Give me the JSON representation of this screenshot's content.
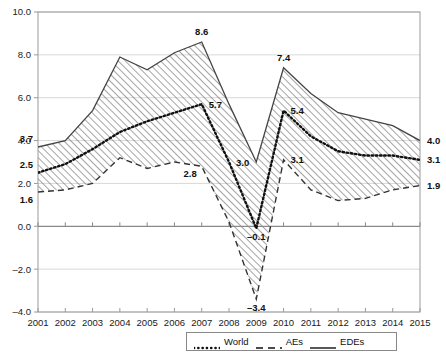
{
  "chart_data": {
    "type": "line",
    "title": "",
    "subtitle": "",
    "xlabel": "",
    "ylabel": "",
    "x": [
      2001,
      2002,
      2003,
      2004,
      2005,
      2006,
      2007,
      2008,
      2009,
      2010,
      2011,
      2012,
      2013,
      2014,
      2015
    ],
    "categories": [
      "2001",
      "2002",
      "2003",
      "2004",
      "2005",
      "2006",
      "2007",
      "2008",
      "2009",
      "2010",
      "2011",
      "2012",
      "2013",
      "2014",
      "2015"
    ],
    "xlim": [
      2001,
      2015
    ],
    "ylim": [
      -4.0,
      10.0
    ],
    "yticks": [
      -4.0,
      -2.0,
      0.0,
      2.0,
      4.0,
      6.0,
      8.0,
      10.0
    ],
    "ytick_labels": [
      "-4.0",
      "-2.0",
      "0.0",
      "2.0",
      "4.0",
      "6.0",
      "8.0",
      "10.0"
    ],
    "grid": true,
    "grid_axis": "y",
    "legend_position": "bottom-right",
    "band_between": [
      "AEs",
      "EDEs"
    ],
    "band_fill": "diagonal-hatch",
    "series": [
      {
        "name": "World",
        "style": "dotted",
        "color": "#111111",
        "values": [
          2.5,
          2.9,
          3.6,
          4.4,
          4.9,
          5.3,
          5.7,
          3.0,
          -0.1,
          5.4,
          4.2,
          3.5,
          3.3,
          3.3,
          3.1
        ]
      },
      {
        "name": "AEs",
        "style": "dashed",
        "color": "#333333",
        "values": [
          1.6,
          1.7,
          2.0,
          3.2,
          2.7,
          3.0,
          2.8,
          0.2,
          -3.4,
          3.1,
          1.7,
          1.2,
          1.3,
          1.7,
          1.9
        ]
      },
      {
        "name": "EDEs",
        "style": "solid",
        "color": "#444444",
        "values": [
          3.7,
          4.0,
          5.4,
          7.9,
          7.3,
          8.1,
          8.6,
          5.7,
          3.0,
          7.4,
          6.2,
          5.3,
          5.0,
          4.7,
          4.0
        ]
      }
    ],
    "annotations": [
      {
        "label": "3.7",
        "series": "EDEs",
        "x": 2001,
        "y": 3.7,
        "pos": "above-left"
      },
      {
        "label": "2.5",
        "series": "World",
        "x": 2001,
        "y": 2.5,
        "pos": "above-left"
      },
      {
        "label": "1.6",
        "series": "AEs",
        "x": 2001,
        "y": 1.6,
        "pos": "below-left"
      },
      {
        "label": "8.6",
        "series": "EDEs",
        "x": 2007,
        "y": 8.6,
        "pos": "above"
      },
      {
        "label": "5.7",
        "series": "World",
        "x": 2007,
        "y": 5.7,
        "pos": "right"
      },
      {
        "label": "2.8",
        "series": "AEs",
        "x": 2007,
        "y": 2.8,
        "pos": "below-left"
      },
      {
        "label": "3.0",
        "series": "EDEs",
        "x": 2009,
        "y": 3.0,
        "pos": "left"
      },
      {
        "label": "-0.1",
        "series": "World",
        "x": 2009,
        "y": -0.1,
        "pos": "below"
      },
      {
        "label": "-3.4",
        "series": "AEs",
        "x": 2009,
        "y": -3.4,
        "pos": "below"
      },
      {
        "label": "7.4",
        "series": "EDEs",
        "x": 2010,
        "y": 7.4,
        "pos": "above"
      },
      {
        "label": "5.4",
        "series": "World",
        "x": 2010,
        "y": 5.4,
        "pos": "right"
      },
      {
        "label": "3.1",
        "series": "AEs",
        "x": 2010,
        "y": 3.1,
        "pos": "right"
      },
      {
        "label": "4.0",
        "series": "EDEs",
        "x": 2015,
        "y": 4.0,
        "pos": "right"
      },
      {
        "label": "3.1",
        "series": "World",
        "x": 2015,
        "y": 3.1,
        "pos": "right"
      },
      {
        "label": "1.9",
        "series": "AEs",
        "x": 2015,
        "y": 1.9,
        "pos": "right"
      }
    ],
    "legend": [
      {
        "label": "World",
        "style": "dotted"
      },
      {
        "label": "AEs",
        "style": "dashed"
      },
      {
        "label": "EDEs",
        "style": "solid"
      }
    ]
  },
  "colors": {
    "frame": "#9a9a9a",
    "grid": "#d9d9d9",
    "axis_zero": "#8a8a8a",
    "text": "#111111",
    "hatch": "#5a5a5a"
  }
}
